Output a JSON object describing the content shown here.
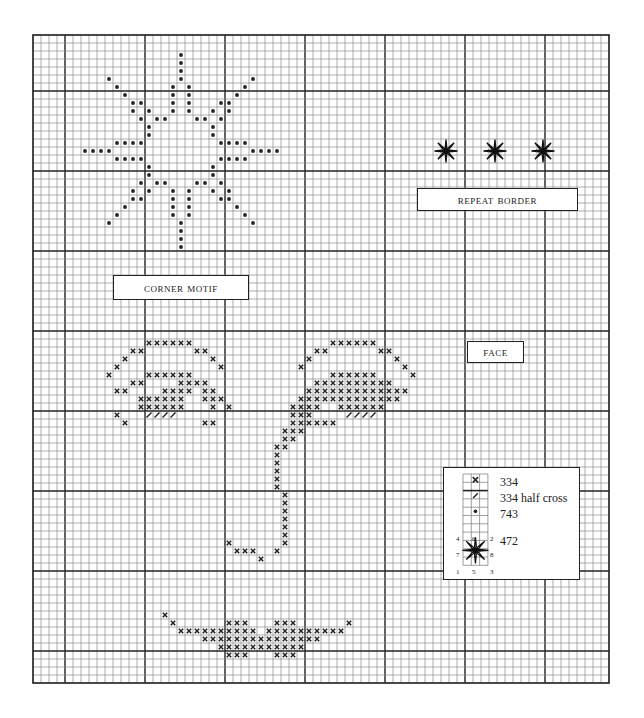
{
  "chart_data": {
    "type": "cross-stitch-chart",
    "grid": {
      "origin_x": 33,
      "origin_y": 35,
      "cell": 8,
      "cols": 72,
      "rows": 81,
      "bold_every": 10,
      "bold_col_offset": 4,
      "bold_row_offset": 7,
      "line_color": "#888888",
      "bold_color": "#222222"
    },
    "labels": {
      "corner_motif": "CORNER MOTIF",
      "repeat_border": "REPEAT BORDER",
      "face": "FACE"
    },
    "legend": {
      "items": [
        {
          "symbol": "cross",
          "color_code": "334",
          "label": "334"
        },
        {
          "symbol": "half-cross",
          "color_code": "334",
          "label": "334 half cross"
        },
        {
          "symbol": "dot",
          "color_code": "743",
          "label": "743"
        },
        {
          "symbol": "star",
          "color_code": "472",
          "label": "472"
        }
      ],
      "star_numbers": [
        "4",
        "6",
        "2",
        "7",
        "8",
        "1",
        "5",
        "3"
      ]
    },
    "corner_motif_dots": [
      [
        18,
        2
      ],
      [
        18,
        3
      ],
      [
        18,
        4
      ],
      [
        9,
        5
      ],
      [
        18,
        5
      ],
      [
        27,
        5
      ],
      [
        10,
        6
      ],
      [
        17,
        6
      ],
      [
        19,
        6
      ],
      [
        26,
        6
      ],
      [
        11,
        7
      ],
      [
        17,
        7
      ],
      [
        19,
        7
      ],
      [
        25,
        7
      ],
      [
        12,
        8
      ],
      [
        13,
        8
      ],
      [
        17,
        8
      ],
      [
        19,
        8
      ],
      [
        23,
        8
      ],
      [
        24,
        8
      ],
      [
        12,
        9
      ],
      [
        14,
        9
      ],
      [
        17,
        9
      ],
      [
        19,
        9
      ],
      [
        22,
        9
      ],
      [
        24,
        9
      ],
      [
        13,
        10
      ],
      [
        15,
        10
      ],
      [
        16,
        10
      ],
      [
        20,
        10
      ],
      [
        21,
        10
      ],
      [
        23,
        10
      ],
      [
        14,
        11
      ],
      [
        22,
        11
      ],
      [
        14,
        12
      ],
      [
        22,
        12
      ],
      [
        10,
        13
      ],
      [
        11,
        13
      ],
      [
        12,
        13
      ],
      [
        13,
        13
      ],
      [
        23,
        13
      ],
      [
        24,
        13
      ],
      [
        25,
        13
      ],
      [
        26,
        13
      ],
      [
        6,
        14
      ],
      [
        7,
        14
      ],
      [
        8,
        14
      ],
      [
        9,
        14
      ],
      [
        27,
        14
      ],
      [
        28,
        14
      ],
      [
        29,
        14
      ],
      [
        30,
        14
      ],
      [
        10,
        15
      ],
      [
        11,
        15
      ],
      [
        12,
        15
      ],
      [
        13,
        15
      ],
      [
        23,
        15
      ],
      [
        24,
        15
      ],
      [
        25,
        15
      ],
      [
        26,
        15
      ],
      [
        14,
        16
      ],
      [
        22,
        16
      ],
      [
        14,
        17
      ],
      [
        22,
        17
      ],
      [
        13,
        18
      ],
      [
        15,
        18
      ],
      [
        16,
        18
      ],
      [
        20,
        18
      ],
      [
        21,
        18
      ],
      [
        23,
        18
      ],
      [
        12,
        19
      ],
      [
        14,
        19
      ],
      [
        17,
        19
      ],
      [
        19,
        19
      ],
      [
        22,
        19
      ],
      [
        24,
        19
      ],
      [
        12,
        20
      ],
      [
        13,
        20
      ],
      [
        17,
        20
      ],
      [
        19,
        20
      ],
      [
        23,
        20
      ],
      [
        24,
        20
      ],
      [
        11,
        21
      ],
      [
        17,
        21
      ],
      [
        19,
        21
      ],
      [
        25,
        21
      ],
      [
        10,
        22
      ],
      [
        17,
        22
      ],
      [
        19,
        22
      ],
      [
        26,
        22
      ],
      [
        9,
        23
      ],
      [
        18,
        23
      ],
      [
        27,
        23
      ],
      [
        18,
        24
      ],
      [
        18,
        25
      ],
      [
        18,
        26
      ]
    ],
    "border_stars": [
      [
        446,
        151
      ],
      [
        495,
        151
      ],
      [
        543,
        151
      ]
    ],
    "face_crosses": [
      [
        14,
        38
      ],
      [
        15,
        38
      ],
      [
        16,
        38
      ],
      [
        17,
        38
      ],
      [
        18,
        38
      ],
      [
        19,
        38
      ],
      [
        12,
        39
      ],
      [
        13,
        39
      ],
      [
        20,
        39
      ],
      [
        21,
        39
      ],
      [
        11,
        40
      ],
      [
        22,
        40
      ],
      [
        10,
        41
      ],
      [
        23,
        41
      ],
      [
        9,
        42
      ],
      [
        14,
        42
      ],
      [
        15,
        42
      ],
      [
        16,
        42
      ],
      [
        17,
        42
      ],
      [
        18,
        42
      ],
      [
        19,
        42
      ],
      [
        12,
        43
      ],
      [
        13,
        43
      ],
      [
        18,
        43
      ],
      [
        19,
        43
      ],
      [
        20,
        43
      ],
      [
        21,
        43
      ],
      [
        10,
        44
      ],
      [
        11,
        44
      ],
      [
        16,
        44
      ],
      [
        17,
        44
      ],
      [
        18,
        44
      ],
      [
        19,
        44
      ],
      [
        21,
        44
      ],
      [
        22,
        44
      ],
      [
        13,
        45
      ],
      [
        14,
        45
      ],
      [
        15,
        45
      ],
      [
        16,
        45
      ],
      [
        17,
        45
      ],
      [
        18,
        45
      ],
      [
        21,
        45
      ],
      [
        22,
        45
      ],
      [
        23,
        45
      ],
      [
        13,
        46
      ],
      [
        14,
        46
      ],
      [
        15,
        46
      ],
      [
        16,
        46
      ],
      [
        17,
        46
      ],
      [
        18,
        46
      ],
      [
        22,
        46
      ],
      [
        24,
        46
      ],
      [
        10,
        47
      ],
      [
        11,
        48
      ],
      [
        21,
        48
      ],
      [
        22,
        48
      ],
      [
        37,
        38
      ],
      [
        38,
        38
      ],
      [
        39,
        38
      ],
      [
        40,
        38
      ],
      [
        41,
        38
      ],
      [
        42,
        38
      ],
      [
        35,
        39
      ],
      [
        36,
        39
      ],
      [
        43,
        39
      ],
      [
        44,
        39
      ],
      [
        34,
        40
      ],
      [
        45,
        40
      ],
      [
        33,
        41
      ],
      [
        46,
        41
      ],
      [
        37,
        42
      ],
      [
        38,
        42
      ],
      [
        39,
        42
      ],
      [
        40,
        42
      ],
      [
        41,
        42
      ],
      [
        42,
        42
      ],
      [
        47,
        42
      ],
      [
        35,
        43
      ],
      [
        36,
        43
      ],
      [
        37,
        43
      ],
      [
        38,
        43
      ],
      [
        39,
        43
      ],
      [
        40,
        43
      ],
      [
        41,
        43
      ],
      [
        42,
        43
      ],
      [
        43,
        43
      ],
      [
        44,
        43
      ],
      [
        34,
        44
      ],
      [
        35,
        44
      ],
      [
        36,
        44
      ],
      [
        37,
        44
      ],
      [
        38,
        44
      ],
      [
        39,
        44
      ],
      [
        40,
        44
      ],
      [
        41,
        44
      ],
      [
        42,
        44
      ],
      [
        43,
        44
      ],
      [
        44,
        44
      ],
      [
        45,
        44
      ],
      [
        46,
        44
      ],
      [
        33,
        45
      ],
      [
        34,
        45
      ],
      [
        35,
        45
      ],
      [
        36,
        45
      ],
      [
        37,
        45
      ],
      [
        38,
        45
      ],
      [
        39,
        45
      ],
      [
        40,
        45
      ],
      [
        41,
        45
      ],
      [
        42,
        45
      ],
      [
        43,
        45
      ],
      [
        44,
        45
      ],
      [
        45,
        45
      ],
      [
        32,
        46
      ],
      [
        33,
        46
      ],
      [
        34,
        46
      ],
      [
        35,
        46
      ],
      [
        38,
        46
      ],
      [
        39,
        46
      ],
      [
        40,
        46
      ],
      [
        41,
        46
      ],
      [
        42,
        46
      ],
      [
        43,
        46
      ],
      [
        32,
        47
      ],
      [
        33,
        47
      ],
      [
        34,
        47
      ],
      [
        32,
        48
      ],
      [
        33,
        48
      ],
      [
        34,
        48
      ],
      [
        35,
        48
      ],
      [
        36,
        48
      ],
      [
        37,
        48
      ],
      [
        31,
        49
      ],
      [
        32,
        49
      ],
      [
        33,
        49
      ],
      [
        31,
        50
      ],
      [
        32,
        50
      ],
      [
        30,
        51
      ],
      [
        31,
        51
      ],
      [
        30,
        52
      ],
      [
        30,
        53
      ],
      [
        30,
        54
      ],
      [
        30,
        55
      ],
      [
        30,
        56
      ],
      [
        31,
        57
      ],
      [
        31,
        58
      ],
      [
        31,
        59
      ],
      [
        31,
        60
      ],
      [
        31,
        61
      ],
      [
        31,
        62
      ],
      [
        24,
        63
      ],
      [
        31,
        63
      ],
      [
        25,
        64
      ],
      [
        26,
        64
      ],
      [
        27,
        64
      ],
      [
        30,
        64
      ],
      [
        28,
        65
      ],
      [
        16,
        72
      ],
      [
        17,
        73
      ],
      [
        24,
        73
      ],
      [
        25,
        73
      ],
      [
        26,
        73
      ],
      [
        30,
        73
      ],
      [
        31,
        73
      ],
      [
        32,
        73
      ],
      [
        39,
        73
      ],
      [
        18,
        74
      ],
      [
        19,
        74
      ],
      [
        20,
        74
      ],
      [
        21,
        74
      ],
      [
        22,
        74
      ],
      [
        23,
        74
      ],
      [
        24,
        74
      ],
      [
        25,
        74
      ],
      [
        26,
        74
      ],
      [
        27,
        74
      ],
      [
        29,
        74
      ],
      [
        30,
        74
      ],
      [
        31,
        74
      ],
      [
        32,
        74
      ],
      [
        33,
        74
      ],
      [
        34,
        74
      ],
      [
        35,
        74
      ],
      [
        36,
        74
      ],
      [
        37,
        74
      ],
      [
        38,
        74
      ],
      [
        21,
        75
      ],
      [
        22,
        75
      ],
      [
        23,
        75
      ],
      [
        24,
        75
      ],
      [
        25,
        75
      ],
      [
        26,
        75
      ],
      [
        27,
        75
      ],
      [
        28,
        75
      ],
      [
        29,
        75
      ],
      [
        30,
        75
      ],
      [
        31,
        75
      ],
      [
        32,
        75
      ],
      [
        33,
        75
      ],
      [
        34,
        75
      ],
      [
        35,
        75
      ],
      [
        23,
        76
      ],
      [
        24,
        76
      ],
      [
        25,
        76
      ],
      [
        26,
        76
      ],
      [
        27,
        76
      ],
      [
        28,
        76
      ],
      [
        29,
        76
      ],
      [
        30,
        76
      ],
      [
        31,
        76
      ],
      [
        32,
        76
      ],
      [
        33,
        76
      ],
      [
        24,
        77
      ],
      [
        25,
        77
      ],
      [
        26,
        77
      ],
      [
        30,
        77
      ],
      [
        31,
        77
      ],
      [
        32,
        77
      ]
    ],
    "face_half_crosses": [
      [
        14,
        47
      ],
      [
        15,
        47
      ],
      [
        16,
        47
      ],
      [
        17,
        47
      ],
      [
        39,
        47
      ],
      [
        40,
        47
      ],
      [
        41,
        47
      ],
      [
        42,
        47
      ]
    ]
  }
}
